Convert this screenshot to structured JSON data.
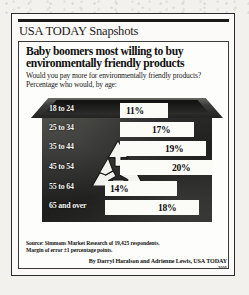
{
  "brand": {
    "title": "USA TODAY Snapshots"
  },
  "headline": "Baby boomers most willing to buy environmentally friendly products",
  "subhead": "Would you pay more for environmentally friendly products? Percentage who would, by age:",
  "footer": {
    "source_line1": "Source: Simmons Market Research of 19,425 respondents.",
    "source_line2": "Margin of error ±1 percentage points.",
    "byline": "By Darryl Haralson and Adrienne Lewis, USA TODAY",
    "byline_mark": "2005"
  },
  "colors": {
    "ink": "#101010",
    "bar": "#fbfbf8",
    "bin_dark": "#232322",
    "paper": "#fbfaf8"
  },
  "icons": {
    "recycle": "recycle-symbol"
  },
  "chart_data": {
    "type": "bar",
    "title": "Baby boomers most willing to buy environmentally friendly products",
    "subtitle": "Would you pay more for environmentally friendly products? Percentage who would, by age:",
    "xlabel": "",
    "ylabel": "Age group",
    "orientation": "horizontal",
    "grid": false,
    "legend": false,
    "xlim": [
      0,
      22
    ],
    "categories": [
      "18 to 24",
      "25 to 34",
      "35 to 44",
      "45 to 54",
      "55 to 64",
      "65 and over"
    ],
    "values": [
      11,
      17,
      19,
      20,
      14,
      18
    ],
    "value_labels": [
      "11%",
      "17%",
      "19%",
      "20%",
      "14%",
      "18%"
    ],
    "source": "Simmons Market Research of 19,425 respondents. Margin of error ±1 percentage points."
  },
  "bars": [
    {
      "age": "18 to 24",
      "value": 11,
      "label": "11%",
      "bar_left": 101,
      "bar_width": 48,
      "label_left": 107,
      "top": 11
    },
    {
      "age": "25 to 34",
      "value": 17,
      "label": "17%",
      "bar_left": 101,
      "bar_width": 74,
      "label_left": 133,
      "top": 30
    },
    {
      "age": "35 to 44",
      "value": 19,
      "label": "19%",
      "bar_left": 101,
      "bar_width": 86,
      "label_left": 146,
      "top": 49
    },
    {
      "age": "45 to 54",
      "value": 20,
      "label": "20%",
      "bar_left": 101,
      "bar_width": 93,
      "label_left": 153,
      "top": 68
    },
    {
      "age": "55 to 64",
      "value": 14,
      "label": "14%",
      "bar_left": 86,
      "bar_width": 72,
      "label_left": 91,
      "top": 89
    },
    {
      "age": "65 and over",
      "value": 18,
      "label": "18%",
      "bar_left": 86,
      "bar_width": 94,
      "label_left": 139,
      "top": 108
    }
  ],
  "age_labels": [
    {
      "text": "18 to 24",
      "top": 12
    },
    {
      "text": "25 to 34",
      "top": 31
    },
    {
      "text": "35 to 44",
      "top": 50
    },
    {
      "text": "45 to 54",
      "top": 70
    },
    {
      "text": "55 to 64",
      "top": 90
    },
    {
      "text": "65 and over",
      "top": 109
    }
  ]
}
